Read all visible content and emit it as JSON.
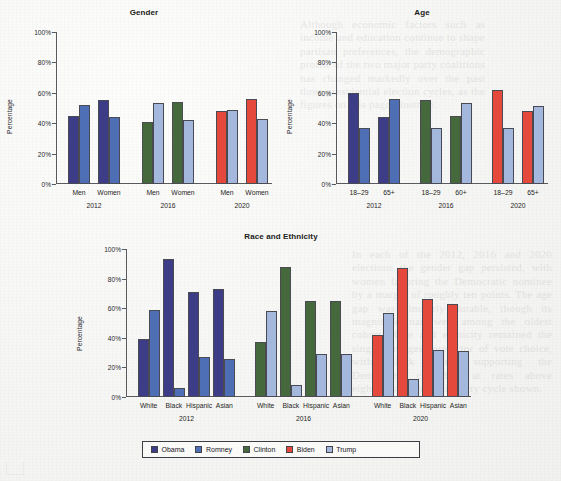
{
  "page": {
    "background_color": "#f6f6f4",
    "ghost_text_left": "Although economic factors such as income and education continue to shape partisan preferences, the demographic profile of the two major party coalitions has changed markedly over the past three presidential election cycles, as the figures on this page illustrate.",
    "ghost_text_right": "In each of the 2012, 2016 and 2020 elections the gender gap persisted, with women favoring the Democratic nominee by a margin of roughly ten points. The age gap was similarly durable, though its magnitude narrowed among the oldest cohort. Race and ethnicity remained the single strongest predictor of vote choice, with Black voters supporting the Democratic candidate at rates above eighty-five percent in every cycle shown."
  },
  "legend": {
    "items": [
      {
        "label": "Obama",
        "color": "#3d3c87"
      },
      {
        "label": "Romney",
        "color": "#4e6fb5"
      },
      {
        "label": "Clinton",
        "color": "#45683c"
      },
      {
        "label": "Biden",
        "color": "#e5493c"
      },
      {
        "label": "Trump",
        "color": "#a4b7dc"
      }
    ]
  },
  "chart_data": [
    {
      "id": "gender",
      "type": "bar",
      "title": "Gender",
      "xlabel": "",
      "ylabel": "Percentage",
      "ylim": [
        0,
        100
      ],
      "yticks": [
        0,
        20,
        40,
        60,
        80,
        100
      ],
      "ytick_labels": [
        "0%",
        "20%",
        "40%",
        "60%",
        "80%",
        "100%"
      ],
      "grid": false,
      "legend_position": "bottom-shared",
      "groups": [
        {
          "group_label": "2012",
          "categories": [
            "Men",
            "Women"
          ],
          "bars": [
            {
              "category": "Men",
              "series": "Obama",
              "value": 45
            },
            {
              "category": "Men",
              "series": "Romney",
              "value": 52
            },
            {
              "category": "Women",
              "series": "Obama",
              "value": 55
            },
            {
              "category": "Women",
              "series": "Romney",
              "value": 44
            }
          ]
        },
        {
          "group_label": "2016",
          "categories": [
            "Men",
            "Women"
          ],
          "bars": [
            {
              "category": "Men",
              "series": "Clinton",
              "value": 41
            },
            {
              "category": "Men",
              "series": "Trump",
              "value": 53
            },
            {
              "category": "Women",
              "series": "Clinton",
              "value": 54
            },
            {
              "category": "Women",
              "series": "Trump",
              "value": 42
            }
          ]
        },
        {
          "group_label": "2020",
          "categories": [
            "Men",
            "Women"
          ],
          "bars": [
            {
              "category": "Men",
              "series": "Biden",
              "value": 48
            },
            {
              "category": "Men",
              "series": "Trump",
              "value": 49
            },
            {
              "category": "Women",
              "series": "Biden",
              "value": 56
            },
            {
              "category": "Women",
              "series": "Trump",
              "value": 43
            }
          ]
        }
      ]
    },
    {
      "id": "age",
      "type": "bar",
      "title": "Age",
      "xlabel": "",
      "ylabel": "Percentage",
      "ylim": [
        0,
        100
      ],
      "yticks": [
        0,
        20,
        40,
        60,
        80,
        100
      ],
      "ytick_labels": [
        "0%",
        "20%",
        "40%",
        "60%",
        "80%",
        "100%"
      ],
      "grid": false,
      "legend_position": "bottom-shared",
      "groups": [
        {
          "group_label": "2012",
          "categories": [
            "18–29",
            "65+"
          ],
          "bars": [
            {
              "category": "18–29",
              "series": "Obama",
              "value": 60
            },
            {
              "category": "18–29",
              "series": "Romney",
              "value": 37
            },
            {
              "category": "65+",
              "series": "Obama",
              "value": 44
            },
            {
              "category": "65+",
              "series": "Romney",
              "value": 56
            }
          ]
        },
        {
          "group_label": "2016",
          "categories": [
            "18–29",
            "60+"
          ],
          "bars": [
            {
              "category": "18–29",
              "series": "Clinton",
              "value": 55
            },
            {
              "category": "18–29",
              "series": "Trump",
              "value": 37
            },
            {
              "category": "60+",
              "series": "Clinton",
              "value": 45
            },
            {
              "category": "60+",
              "series": "Trump",
              "value": 53
            }
          ]
        },
        {
          "group_label": "2020",
          "categories": [
            "18–29",
            "65+"
          ],
          "bars": [
            {
              "category": "18–29",
              "series": "Biden",
              "value": 62
            },
            {
              "category": "18–29",
              "series": "Trump",
              "value": 37
            },
            {
              "category": "65+",
              "series": "Biden",
              "value": 48
            },
            {
              "category": "65+",
              "series": "Trump",
              "value": 51
            }
          ]
        }
      ]
    },
    {
      "id": "race",
      "type": "bar",
      "title": "Race and Ethnicity",
      "xlabel": "",
      "ylabel": "Percentage",
      "ylim": [
        0,
        100
      ],
      "yticks": [
        0,
        20,
        40,
        60,
        80,
        100
      ],
      "ytick_labels": [
        "0%",
        "20%",
        "40%",
        "60%",
        "80%",
        "100%"
      ],
      "grid": false,
      "legend_position": "bottom",
      "groups": [
        {
          "group_label": "2012",
          "categories": [
            "White",
            "Black",
            "Hispanic",
            "Asian"
          ],
          "bars": [
            {
              "category": "White",
              "series": "Obama",
              "value": 39
            },
            {
              "category": "White",
              "series": "Romney",
              "value": 59
            },
            {
              "category": "Black",
              "series": "Obama",
              "value": 93
            },
            {
              "category": "Black",
              "series": "Romney",
              "value": 6
            },
            {
              "category": "Hispanic",
              "series": "Obama",
              "value": 71
            },
            {
              "category": "Hispanic",
              "series": "Romney",
              "value": 27
            },
            {
              "category": "Asian",
              "series": "Obama",
              "value": 73
            },
            {
              "category": "Asian",
              "series": "Romney",
              "value": 26
            }
          ]
        },
        {
          "group_label": "2016",
          "categories": [
            "White",
            "Black",
            "Hispanic",
            "Asian"
          ],
          "bars": [
            {
              "category": "White",
              "series": "Clinton",
              "value": 37
            },
            {
              "category": "White",
              "series": "Trump",
              "value": 58
            },
            {
              "category": "Black",
              "series": "Clinton",
              "value": 88
            },
            {
              "category": "Black",
              "series": "Trump",
              "value": 8
            },
            {
              "category": "Hispanic",
              "series": "Clinton",
              "value": 65
            },
            {
              "category": "Hispanic",
              "series": "Trump",
              "value": 29
            },
            {
              "category": "Asian",
              "series": "Clinton",
              "value": 65
            },
            {
              "category": "Asian",
              "series": "Trump",
              "value": 29
            }
          ]
        },
        {
          "group_label": "2020",
          "categories": [
            "White",
            "Black",
            "Hispanic",
            "Asian"
          ],
          "bars": [
            {
              "category": "White",
              "series": "Biden",
              "value": 42
            },
            {
              "category": "White",
              "series": "Trump",
              "value": 57
            },
            {
              "category": "Black",
              "series": "Biden",
              "value": 87
            },
            {
              "category": "Black",
              "series": "Trump",
              "value": 12
            },
            {
              "category": "Hispanic",
              "series": "Biden",
              "value": 66
            },
            {
              "category": "Hispanic",
              "series": "Trump",
              "value": 32
            },
            {
              "category": "Asian",
              "series": "Biden",
              "value": 63
            },
            {
              "category": "Asian",
              "series": "Trump",
              "value": 31
            }
          ]
        }
      ]
    }
  ]
}
